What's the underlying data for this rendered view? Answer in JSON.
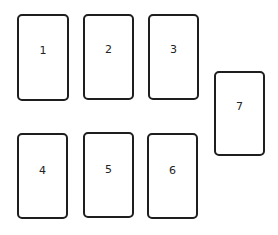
{
  "diagram": {
    "type": "card-spread-layout",
    "stroke_color": "#1e1e1e",
    "background": "#ffffff",
    "cards": [
      {
        "label": "1",
        "x": 17,
        "y": 14,
        "w": 52,
        "h": 87,
        "label_top": 29
      },
      {
        "label": "2",
        "x": 83,
        "y": 14,
        "w": 51,
        "h": 86,
        "label_top": 28
      },
      {
        "label": "3",
        "x": 148,
        "y": 14,
        "w": 51,
        "h": 86,
        "label_top": 28
      },
      {
        "label": "4",
        "x": 17,
        "y": 133,
        "w": 51,
        "h": 86,
        "label_top": 30
      },
      {
        "label": "5",
        "x": 83,
        "y": 132,
        "w": 51,
        "h": 86,
        "label_top": 30
      },
      {
        "label": "6",
        "x": 147,
        "y": 133,
        "w": 51,
        "h": 86,
        "label_top": 30
      },
      {
        "label": "7",
        "x": 214,
        "y": 71,
        "w": 51,
        "h": 85,
        "label_top": 28
      }
    ]
  }
}
